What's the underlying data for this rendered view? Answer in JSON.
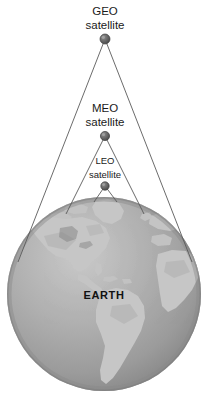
{
  "figure": {
    "background_color": "#ffffff",
    "width": 208,
    "height": 404
  },
  "satellites": [
    {
      "id": "geo",
      "name": "GEO satellite",
      "label_line1": "GEO",
      "label_line2": "satellite",
      "dot_color": "#6d6d6d",
      "position": {
        "x": 105,
        "y": 39
      },
      "label_position": {
        "x": 105,
        "y_line1": 11,
        "y_line2": 25
      },
      "coverage_cone": {
        "left_x": 18,
        "right_x": 192,
        "base_y": 262
      }
    },
    {
      "id": "meo",
      "name": "MEO satellite",
      "label_line1": "MEO",
      "label_line2": "satellite",
      "dot_color": "#6d6d6d",
      "position": {
        "x": 105,
        "y": 136
      },
      "label_position": {
        "x": 105,
        "y_line1": 108,
        "y_line2": 122
      },
      "coverage_cone": {
        "left_x": 66,
        "right_x": 144,
        "base_y": 214
      }
    },
    {
      "id": "leo",
      "name": "LEO satellite",
      "label_line1": "LEO",
      "label_line2": "satellite",
      "dot_color": "#6d6d6d",
      "position": {
        "x": 105,
        "y": 186
      },
      "label_position": {
        "x": 105,
        "y_line1": 160,
        "y_line2": 174
      },
      "coverage_cone": {
        "left_x": 94,
        "right_x": 117,
        "base_y": 201
      }
    }
  ],
  "earth": {
    "label": "EARTH",
    "label_position": {
      "x": 104,
      "y": 295
    },
    "center": {
      "x": 104,
      "y": 294
    },
    "radius": 97,
    "ocean_color": "#a2a2a2",
    "land_color": "#c3c3c3",
    "edge_shadow_color": "#8d8d8d",
    "highlight_color": "#bdbdbd",
    "visible_continents": [
      "North America",
      "Central America",
      "South America",
      "Greenland",
      "Western Europe",
      "West Africa"
    ]
  },
  "colors": {
    "line": "#5a5a5a",
    "text": "#1a1a1a",
    "earth_text": "#111111"
  }
}
